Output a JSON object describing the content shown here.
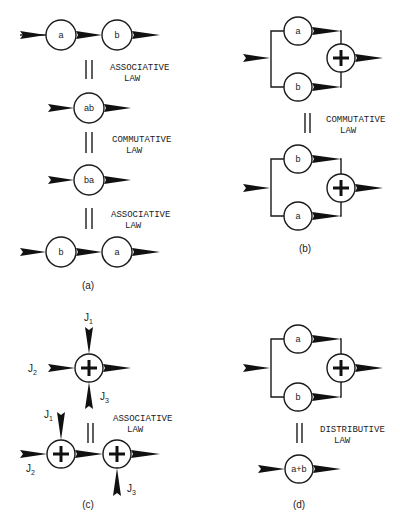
{
  "figure": {
    "panels": [
      {
        "id": "a",
        "caption": "(a)",
        "rows": [
          {
            "type": "series",
            "nodes": [
              "a",
              "b"
            ]
          },
          {
            "type": "law",
            "label_line1": "ASSOCIATIVE",
            "label_line2": "LAW"
          },
          {
            "type": "single",
            "nodes": [
              "ab"
            ]
          },
          {
            "type": "law",
            "label_line1": "COMMUTATIVE",
            "label_line2": "LAW"
          },
          {
            "type": "single",
            "nodes": [
              "ba"
            ]
          },
          {
            "type": "law",
            "label_line1": "ASSOCIATIVE",
            "label_line2": "LAW"
          },
          {
            "type": "series",
            "nodes": [
              "b",
              "a"
            ]
          }
        ]
      },
      {
        "id": "b",
        "caption": "(b)",
        "top": {
          "upper": "a",
          "lower": "b",
          "sum": "+"
        },
        "law": {
          "label_line1": "COMMUTATIVE",
          "label_line2": "LAW"
        },
        "bottom": {
          "upper": "b",
          "lower": "a",
          "sum": "+"
        }
      },
      {
        "id": "c",
        "caption": "(c)",
        "top": {
          "sum": "+",
          "inputs": [
            "J1",
            "J2",
            "J3"
          ]
        },
        "law": {
          "label_line1": "ASSOCIATIVE",
          "label_line2": "LAW"
        },
        "bottom": {
          "sums": [
            "+",
            "+"
          ],
          "inputs": [
            "J1",
            "J2",
            "J3"
          ]
        }
      },
      {
        "id": "d",
        "caption": "(d)",
        "top": {
          "upper": "a",
          "lower": "b",
          "sum": "+"
        },
        "law": {
          "label_line1": "DISTRIBUTIVE",
          "label_line2": "LAW"
        },
        "bottom": {
          "nodes": [
            "a+b"
          ]
        }
      }
    ],
    "labels": {
      "a_r1_n1": "a",
      "a_r1_n2": "b",
      "a_ab": "ab",
      "a_ba": "ba",
      "a_r4_n1": "b",
      "a_r4_n2": "a",
      "a_law1_l1": "ASSOCIATIVE",
      "a_law1_l2": "LAW",
      "a_law2_l1": "COMMUTATIVE",
      "a_law2_l2": "LAW",
      "a_law3_l1": "ASSOCIATIVE",
      "a_law3_l2": "LAW",
      "b_top_upper": "a",
      "b_top_lower": "b",
      "b_law_l1": "COMMUTATIVE",
      "b_law_l2": "LAW",
      "b_bot_upper": "b",
      "b_bot_lower": "a",
      "c_law_l1": "ASSOCIATIVE",
      "c_law_l2": "LAW",
      "j": "J",
      "j1": "1",
      "j2": "2",
      "j3": "3",
      "d_top_upper": "a",
      "d_top_lower": "b",
      "d_law_l1": "DISTRIBUTIVE",
      "d_law_l2": "LAW",
      "d_sum": "a+b",
      "cap_a": "(a)",
      "cap_b": "(b)",
      "cap_c": "(c)",
      "cap_d": "(d)"
    },
    "colors": {
      "ink": "#111111",
      "background": "#ffffff"
    }
  }
}
